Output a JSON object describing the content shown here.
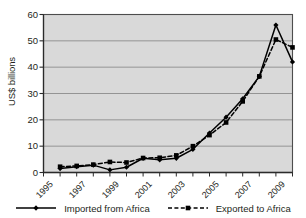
{
  "chart_data": {
    "type": "line",
    "title": "",
    "subtitle": "",
    "xlabel": "",
    "ylabel": "US$ billions",
    "ylim": [
      0,
      60
    ],
    "yticks": [
      0,
      10,
      20,
      30,
      40,
      50,
      60
    ],
    "xlim": [
      1995,
      2010
    ],
    "xticks": [
      1995,
      1997,
      1999,
      2001,
      2003,
      2005,
      2007,
      2009
    ],
    "xticklabels": [
      "1995",
      "1997",
      "1999",
      "2001",
      "2003",
      "2005",
      "2007",
      "2009"
    ],
    "grid": "horizontal",
    "legend_position": "bottom",
    "plot_background": "#d9d9d9",
    "x": [
      1996,
      1997,
      1998,
      1999,
      2000,
      2001,
      2002,
      2003,
      2004,
      2005,
      2006,
      2007,
      2008,
      2009,
      2010
    ],
    "series": [
      {
        "name": "Imported from Africa",
        "style": "solid",
        "color": "#000000",
        "marker": "diamond",
        "values": [
          1.5,
          2.2,
          2.8,
          1.0,
          2.0,
          5.4,
          4.8,
          5.4,
          8.8,
          15.0,
          21.0,
          28.0,
          36.5,
          56.0,
          42.0
        ]
      },
      {
        "name": "Exported to Africa",
        "style": "dashed",
        "color": "#000000",
        "marker": "square",
        "values": [
          2.2,
          2.5,
          3.0,
          4.0,
          3.8,
          5.5,
          5.6,
          6.5,
          10.0,
          14.2,
          19.0,
          27.0,
          36.5,
          50.5,
          47.5
        ]
      }
    ]
  },
  "legend": {
    "items": [
      {
        "label": "Imported from Africa",
        "style": "solid"
      },
      {
        "label": "Exported to Africa",
        "style": "dashed"
      }
    ]
  }
}
